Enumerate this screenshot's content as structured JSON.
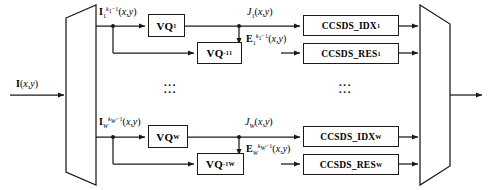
{
  "diagram": {
    "input": {
      "label_html": "<b>I</b>(<i>x</i>,<i>y</i>)",
      "name": "input-image-signal"
    },
    "demux": {
      "name": "demultiplexer",
      "shape": "trapezoid-right-widening"
    },
    "mux": {
      "name": "multiplexer",
      "shape": "trapezoid-right-narrowing"
    },
    "channels": [
      {
        "index": "1",
        "band_label_html": "<b>I</b><sub>1</sub><sup><i>k</i><sub>1</sub>&minus;1</sup>(<i>x</i>,<i>y</i>)",
        "vq_label_html": "VQ<sub>1</sub>",
        "vq_inv_label_html": "VQ<sup>-1</sup><sub>1</sub>",
        "index_signal_html": "<i>J</i><sub>1</sub>(<i>x</i>,<i>y</i>)",
        "residual_signal_html": "<b>E</b><sub>1</sub><sup><i>k</i><sub>1</sub>&minus;1</sup>(<i>x</i>,<i>y</i>)",
        "ccsds_idx_label_html": "CCSDS_IDX<sub>1</sub>",
        "ccsds_res_label_html": "CCSDS_RES<sub>1</sub>"
      },
      {
        "index": "W",
        "band_label_html": "<b>I</b><sub><i>W</i></sub><sup><i>k</i><sub><i>W</i></sub>&minus;1</sup>(<i>x</i>,<i>y</i>)",
        "vq_label_html": "VQ<sub>W</sub>",
        "vq_inv_label_html": "VQ<sup>-1</sup><sub>W</sub>",
        "index_signal_html": "<i>J</i><sub><i>W</i></sub>(<i>x</i>,<i>y</i>)",
        "residual_signal_html": "<b>E</b><sub><i>W</i></sub><sup><i>k</i><sub><i>W</i></sub>&minus;1</sup>(<i>x</i>,<i>y</i>)",
        "ccsds_idx_label_html": "CCSDS_IDX<sub>W</sub>",
        "ccsds_res_label_html": "CCSDS_RES<sub>W</sub>"
      }
    ],
    "ellipsis": {
      "glyph": "···",
      "rows": 2
    },
    "colors": {
      "stroke": "#1a1a1a",
      "background": "#ffffff",
      "text": "#000000"
    }
  }
}
